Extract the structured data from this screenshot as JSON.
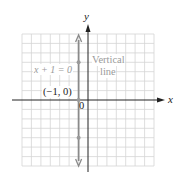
{
  "diagram": {
    "equation_label": "x + 1 = 0",
    "annotation_line1": "Vertical",
    "annotation_line2": "line",
    "point_label": "(−1, 0)",
    "origin_label": "0",
    "x_axis_label": "x",
    "y_axis_label": "y",
    "line_x_value": -1,
    "points": [
      {
        "x": -1,
        "y": 4
      },
      {
        "x": -1,
        "y": 0
      },
      {
        "x": -1,
        "y": -4
      }
    ],
    "grid": {
      "xmin": -7,
      "xmax": 7,
      "ymin": -7,
      "ymax": 7,
      "step": 1
    },
    "colors": {
      "grid": "#d4d4d4",
      "axis": "#222222",
      "line": "#8a8a8a",
      "label": "#9a9a9a",
      "text": "#222222"
    }
  }
}
